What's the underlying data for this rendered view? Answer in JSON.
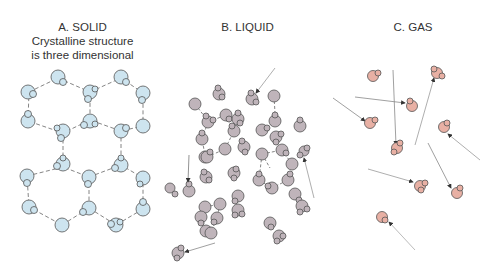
{
  "panels": [
    {
      "id": "solid",
      "title": "A. SOLID",
      "subtitle_line1": "Crystalline structure",
      "subtitle_line2": "is three dimensional",
      "molecule_color": "#cde4ef",
      "arrangement": "hexagonal lattice of water molecules joined by dashed hydrogen bonds"
    },
    {
      "id": "liquid",
      "title": "B. LIQUID",
      "molecule_color": "#bfb4ba",
      "arrangement": "disordered clusters of water molecules with partial hydrogen bonds; some molecules moving (arrows)"
    },
    {
      "id": "gas",
      "title": "C. GAS",
      "molecule_color": "#e8b0a4",
      "arrangement": "widely separated individual water molecules moving freely (arrows with motion trails)"
    }
  ],
  "colors": {
    "outline": "#555555",
    "bond": "#666666",
    "arrow": "#333333",
    "text": "#333333"
  }
}
